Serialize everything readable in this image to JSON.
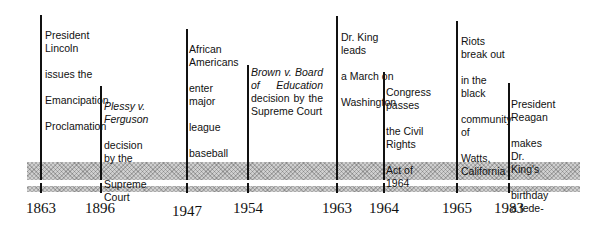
{
  "timeline": {
    "events": [
      {
        "year": "1863",
        "x": 40,
        "top": 17,
        "label_lines": [
          "President Lincoln",
          "issues the",
          "Emancipation",
          "Proclamation"
        ]
      },
      {
        "year": "1896",
        "x": 100,
        "top": 88,
        "label_italic": "Plessy v. Ferguson",
        "label_lines": [
          "decision by the",
          "Supreme Court"
        ]
      },
      {
        "year": "1947",
        "x": 186,
        "top": 31,
        "label_lines": [
          "African Americans",
          "enter major",
          "league",
          "baseball"
        ]
      },
      {
        "year": "1954",
        "x": 247,
        "top": 67,
        "label_italic": "Brown v. Board of",
        "label_italic2": "Education",
        "label_rest": "decision by the Supreme Court"
      },
      {
        "year": "1963",
        "x": 336,
        "top": 19,
        "label_lines": [
          "Dr. King leads",
          "a March on",
          "Washington"
        ]
      },
      {
        "year": "1964",
        "x": 383,
        "top": 74,
        "label_lines": [
          "Congress passes",
          "the Civil Rights",
          "Act of 1964"
        ]
      },
      {
        "year": "1965",
        "x": 456,
        "top": 23,
        "label_lines": [
          "Riots break out",
          "in the black",
          "community of",
          "Watts, California"
        ]
      },
      {
        "year": "1983",
        "x": 508,
        "top": 85,
        "label_lines": [
          "President Reagan",
          "makes Dr. King's",
          "birthday a fede-",
          "ral holiday"
        ]
      }
    ],
    "band_color": "#cfcfcf",
    "line_color": "#111111"
  }
}
